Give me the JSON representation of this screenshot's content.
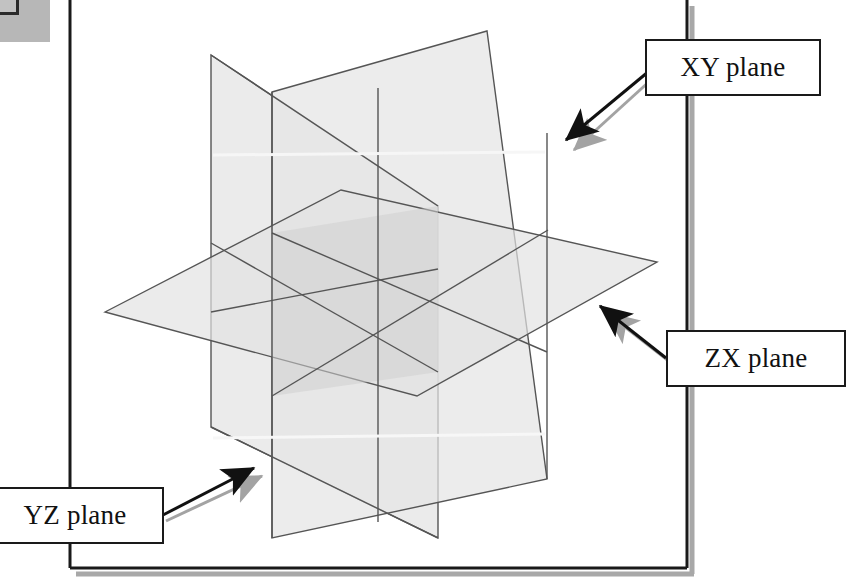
{
  "figure": {
    "type": "3d-plane-diagram"
  },
  "callouts": [
    {
      "id": "xy",
      "label": "XY plane",
      "points_to": "vertical-plane-right",
      "arrow": "down-left"
    },
    {
      "id": "zx",
      "label": "ZX plane",
      "points_to": "horizontal-plane",
      "arrow": "up-left"
    },
    {
      "id": "yz",
      "label": "YZ plane",
      "points_to": "vertical-plane-left",
      "arrow": "up-right"
    }
  ],
  "planes": [
    {
      "id": "yz",
      "name": "YZ plane",
      "orientation": "vertical, receding to the right",
      "fill": "#e6e6e6"
    },
    {
      "id": "xy",
      "name": "XY plane",
      "orientation": "vertical, receding to the left",
      "fill": "#e3e3e3"
    },
    {
      "id": "zx",
      "name": "ZX plane",
      "orientation": "horizontal",
      "fill": "#e2e2e2"
    }
  ],
  "colors": {
    "plane_fill": "#e4e4e4",
    "plane_overlap": "#d2d2d2",
    "plane_stroke": "#4a4a4a",
    "callout_border": "#1a1a1a",
    "callout_background": "#ffffff",
    "shadow": "#9a9a9a",
    "page_border": "#1a1a1a",
    "scan_artifact": "#b7b7b7"
  },
  "page_frame": {
    "description": "document page border visible behind the figure",
    "left_x": 70,
    "right_x": 687,
    "bottom_y": 568
  }
}
